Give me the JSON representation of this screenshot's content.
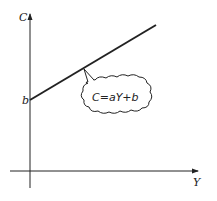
{
  "diagram": {
    "type": "linear-function-graph",
    "y_axis_label": "C",
    "x_axis_label": "Y",
    "intercept_label": "b",
    "equation_label": "C=aY+b",
    "colors": {
      "stroke": "#222222",
      "background": "#ffffff"
    }
  }
}
